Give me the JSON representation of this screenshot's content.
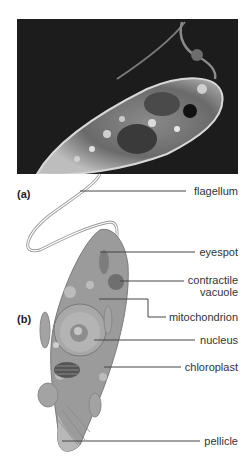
{
  "figure": {
    "panels": [
      {
        "id": "a",
        "label": "(a)",
        "type": "micrograph"
      },
      {
        "id": "b",
        "label": "(b)",
        "type": "illustration"
      }
    ],
    "labels": [
      {
        "name": "flagellum",
        "text": "flagellum"
      },
      {
        "name": "eyespot",
        "text": "eyespot"
      },
      {
        "name": "contractile-vacuole",
        "text_line1": "contractile",
        "text_line2": "vacuole"
      },
      {
        "name": "mitochondrion",
        "text": "mitochondrion"
      },
      {
        "name": "nucleus",
        "text": "nucleus"
      },
      {
        "name": "chloroplast",
        "text": "chloroplast"
      },
      {
        "name": "pellicle",
        "text": "pellicle"
      }
    ]
  }
}
